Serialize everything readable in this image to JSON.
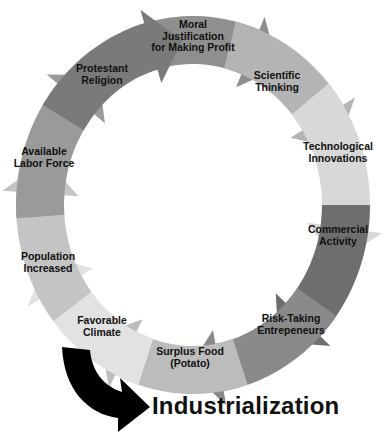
{
  "diagram": {
    "type": "cycle",
    "direction": "clockwise",
    "steps": [
      {
        "label": "Moral\nJustification\nfor Making Profit",
        "line1": "Moral",
        "line2": "Justification",
        "line3": "for Making Profit",
        "color": "#8f8f8f"
      },
      {
        "label": "Scientific\nThinking",
        "line1": "Scientific",
        "line2": "Thinking",
        "color": "#b4b4b4"
      },
      {
        "label": "Technological\nInnovations",
        "line1": "Technological",
        "line2": "Innovations",
        "color": "#d8d8d8"
      },
      {
        "label": "Commercial\nActivity",
        "line1": "Commercial",
        "line2": "Activity",
        "color": "#6e6e6e"
      },
      {
        "label": "Risk-Taking\nEntrepeneurs",
        "line1": "Risk-Taking",
        "line2": "Entrepeneurs",
        "color": "#8a8a8a"
      },
      {
        "label": "Surplus Food\n(Potato)",
        "line1": "Surplus Food",
        "line2": "(Potato)",
        "color": "#bcbcbc"
      },
      {
        "label": "Favorable\nClimate",
        "line1": "Favorable",
        "line2": "Climate",
        "color": "#e2e2e2"
      },
      {
        "label": "Population\nIncreased",
        "line1": "Population",
        "line2": "Increased",
        "color": "#c4c4c4"
      },
      {
        "label": "Available\nLabor Force",
        "line1": "Available",
        "line2": "Labor Force",
        "color": "#9a9a9a"
      },
      {
        "label": "Protestant\nReligion",
        "line1": "Protestant",
        "line2": "Religion",
        "color": "#7a7a7a"
      }
    ],
    "outcome": {
      "label": "Industrialization",
      "arrow_color": "#000000"
    }
  }
}
